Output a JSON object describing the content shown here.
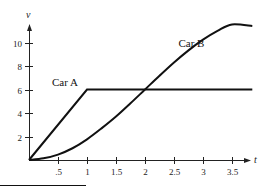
{
  "chart_data": {
    "type": "line",
    "title": "",
    "xlabel": "t",
    "ylabel": "v",
    "xlim": [
      0,
      4
    ],
    "ylim": [
      0,
      12
    ],
    "grid": false,
    "x_ticks": [
      0.5,
      1,
      1.5,
      2,
      2.5,
      3,
      3.5
    ],
    "x_tick_labels": [
      ".5",
      "1",
      "1.5",
      "2",
      "2.5",
      "3",
      "3.5"
    ],
    "y_ticks": [
      2,
      4,
      6,
      8,
      10
    ],
    "y_tick_labels": [
      "2",
      "4",
      "6",
      "8",
      "10"
    ],
    "series": [
      {
        "name": "Car A",
        "x": [
          0,
          1,
          3.85
        ],
        "y": [
          0,
          6,
          6
        ]
      },
      {
        "name": "Car B",
        "x": [
          0,
          0.25,
          0.5,
          0.75,
          1,
          1.25,
          1.5,
          1.75,
          2,
          2.25,
          2.5,
          2.75,
          3,
          3.25,
          3.5,
          3.85
        ],
        "y": [
          0,
          0.14,
          0.46,
          1.0,
          1.76,
          2.69,
          3.7,
          4.83,
          6.0,
          7.17,
          8.3,
          9.33,
          10.24,
          10.99,
          11.54,
          11.4
        ]
      }
    ],
    "annotations": [
      {
        "text": "Car A",
        "x": 0.62,
        "y": 6.3
      },
      {
        "text": "Car B",
        "x": 2.8,
        "y": 9.6
      }
    ]
  }
}
